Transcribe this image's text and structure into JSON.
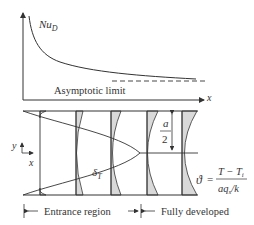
{
  "top_plot": {
    "y_label": "Nu",
    "y_label_sub": "D",
    "x_label": "x",
    "annotation": "Asymptotic limit"
  },
  "channel": {
    "axis_y": "y",
    "axis_x": "x",
    "half_width_num": "a",
    "half_width_den": "2",
    "boundary_layer": "δ",
    "boundary_layer_sub": "T",
    "theta_symbol": "ϑ",
    "theta_equals": "=",
    "theta_num": "T − T",
    "theta_num_sub": "i",
    "theta_den": "aq",
    "theta_den_sub": "s",
    "theta_den_tail": "/k"
  },
  "regions": {
    "entrance": "Entrance region",
    "developed": "Fully developed"
  },
  "colors": {
    "line": "#333333",
    "shade": "#d9d9d9"
  }
}
